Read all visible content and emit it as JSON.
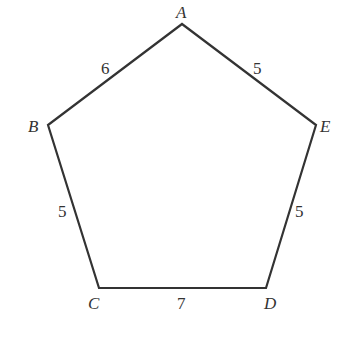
{
  "figure": {
    "type": "pentagon",
    "vertices": [
      {
        "name": "A",
        "x": 182,
        "y": 24
      },
      {
        "name": "B",
        "x": 48,
        "y": 125
      },
      {
        "name": "C",
        "x": 99,
        "y": 288
      },
      {
        "name": "D",
        "x": 266,
        "y": 288
      },
      {
        "name": "E",
        "x": 316,
        "y": 125
      }
    ],
    "vertex_labels": {
      "A": "A",
      "B": "B",
      "C": "C",
      "D": "D",
      "E": "E"
    },
    "edges": [
      {
        "from": "A",
        "to": "B",
        "length_label": "6"
      },
      {
        "from": "B",
        "to": "C",
        "length_label": "5"
      },
      {
        "from": "C",
        "to": "D",
        "length_label": "7"
      },
      {
        "from": "D",
        "to": "E",
        "length_label": "5"
      },
      {
        "from": "E",
        "to": "A",
        "length_label": "5"
      }
    ],
    "stroke_color": "#333333"
  }
}
